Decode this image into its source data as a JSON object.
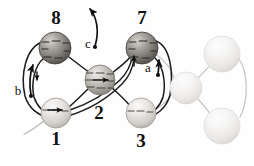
{
  "figure": {
    "kind": "molecular-mechanism-diagram",
    "background_color": "#fefefe",
    "ink_color": "#111111",
    "faded_ink_color": "#b8b8b8"
  },
  "nodes": [
    {
      "id": "node-8",
      "label": "8",
      "label_x": 56,
      "label_y": 17,
      "cx": 55,
      "cy": 48,
      "r": 16,
      "shade": "dark",
      "fill_light": "#cdc9c4",
      "fill_dark": "#5f5b57",
      "opacity": 1
    },
    {
      "id": "node-7",
      "label": "7",
      "label_x": 142,
      "label_y": 17,
      "cx": 142,
      "cy": 48,
      "r": 16,
      "shade": "dark",
      "fill_light": "#cdc9c4",
      "fill_dark": "#5f5b57",
      "opacity": 1
    },
    {
      "id": "node-2",
      "label": "2",
      "label_x": 99,
      "label_y": 112,
      "cx": 100,
      "cy": 80,
      "r": 15,
      "shade": "medium",
      "fill_light": "#e3e0dc",
      "fill_dark": "#8d8984",
      "opacity": 1
    },
    {
      "id": "node-1",
      "label": "1",
      "label_x": 56,
      "label_y": 138,
      "cx": 56,
      "cy": 113,
      "r": 15,
      "shade": "light",
      "fill_light": "#f0eeec",
      "fill_dark": "#b3afab",
      "opacity": 1
    },
    {
      "id": "node-3",
      "label": "3",
      "label_x": 141,
      "label_y": 140,
      "cx": 141,
      "cy": 113,
      "r": 15,
      "shade": "light",
      "fill_light": "#f0eeec",
      "fill_dark": "#b3afab",
      "opacity": 1
    },
    {
      "id": "node-faded-center",
      "label": "",
      "cx": 186,
      "cy": 88,
      "r": 16,
      "shade": "faded",
      "fill_light": "#f6f5f4",
      "fill_dark": "#dedbd8",
      "opacity": 1
    },
    {
      "id": "node-faded-top",
      "label": "",
      "cx": 222,
      "cy": 54,
      "r": 18,
      "shade": "faded",
      "fill_light": "#f6f5f4",
      "fill_dark": "#dedbd8",
      "opacity": 1
    },
    {
      "id": "node-faded-bottom",
      "label": "",
      "cx": 222,
      "cy": 126,
      "r": 18,
      "shade": "faded",
      "fill_light": "#f6f5f4",
      "fill_dark": "#dedbd8",
      "opacity": 1
    }
  ],
  "arrow_labels": [
    {
      "id": "arrow-label-a",
      "label": "a",
      "x": 148,
      "y": 67
    },
    {
      "id": "arrow-label-b",
      "label": "b",
      "x": 18,
      "y": 90
    },
    {
      "id": "arrow-label-c",
      "label": "c",
      "x": 88,
      "y": 43
    }
  ],
  "counts": {
    "labeled_nodes": 5,
    "faded_nodes": 3,
    "mechanism_arrows": 3
  }
}
